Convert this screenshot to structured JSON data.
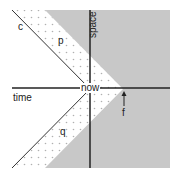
{
  "diagram": {
    "title": "",
    "labels": {
      "space": "space",
      "time": "time",
      "now": "now",
      "c": "c",
      "p": "p",
      "q": "q",
      "f": "f"
    },
    "colors": {
      "shaded_region": "#c8c8c8",
      "axis": "#222222",
      "line": "#333333",
      "dots": "#b0b0b0",
      "background": "#ffffff"
    }
  }
}
